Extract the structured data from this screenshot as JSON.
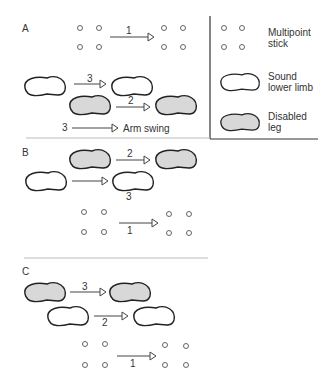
{
  "panels": {
    "A": {
      "label": "A",
      "step1": "1",
      "step2": "2",
      "step3": "3",
      "arm_swing_num": "3",
      "arm_swing_label": "Arm swing"
    },
    "B": {
      "label": "B",
      "step1": "1",
      "step2": "2",
      "step3": "3"
    },
    "C": {
      "label": "C",
      "step1": "1",
      "step2": "2",
      "step3": "3"
    }
  },
  "legend": {
    "items": [
      {
        "icon": "multipoint-stick-icon",
        "label_line1": "Multipoint",
        "label_line2": "stick"
      },
      {
        "icon": "sound-foot-icon",
        "label_line1": "Sound",
        "label_line2": "lower limb"
      },
      {
        "icon": "disabled-foot-icon",
        "label_line1": "Disabled",
        "label_line2": "leg"
      }
    ]
  },
  "colors": {
    "disabled_fill": "#d8d8d8",
    "outline": "#222222",
    "background": "#ffffff"
  }
}
